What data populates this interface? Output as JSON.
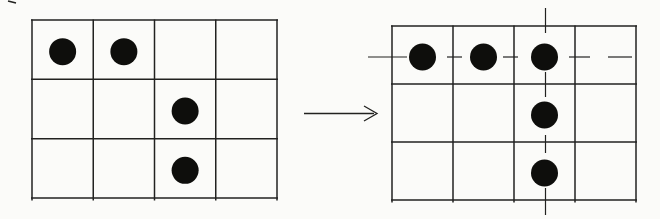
{
  "colors": {
    "background": "#fbfbf9",
    "ink": "#222220",
    "dot": "#0e0e0c"
  },
  "dot_radius": 13.5,
  "left_grid": {
    "rows": 3,
    "cols": 4,
    "x": 32,
    "y": 20,
    "width": 245,
    "height": 178,
    "dots": [
      [
        0,
        0
      ],
      [
        0,
        1
      ],
      [
        1,
        2
      ],
      [
        2,
        2
      ]
    ]
  },
  "arrow": {
    "x1": 304,
    "y1": 113,
    "x2": 377,
    "y2": 113
  },
  "right_grid": {
    "rows": 3,
    "cols": 4,
    "x": 392,
    "y": 26,
    "width": 244,
    "height": 174,
    "dots": [
      [
        0,
        0
      ],
      [
        0,
        1
      ],
      [
        0,
        2
      ],
      [
        1,
        2
      ],
      [
        2,
        2
      ]
    ],
    "row_marker": {
      "y": 57,
      "dashes": [
        [
          368,
          407
        ],
        [
          447,
          462
        ],
        [
          503,
          518
        ],
        [
          569,
          590
        ],
        [
          608,
          632
        ]
      ]
    },
    "col_marker": {
      "x": 545.5,
      "dashes": [
        [
          8,
          33
        ],
        [
          72,
          97
        ],
        [
          135,
          153
        ],
        [
          188,
          215
        ]
      ]
    }
  },
  "stray_mark": {
    "x1": 8,
    "y1": 1,
    "x2": 16,
    "y2": 3
  }
}
